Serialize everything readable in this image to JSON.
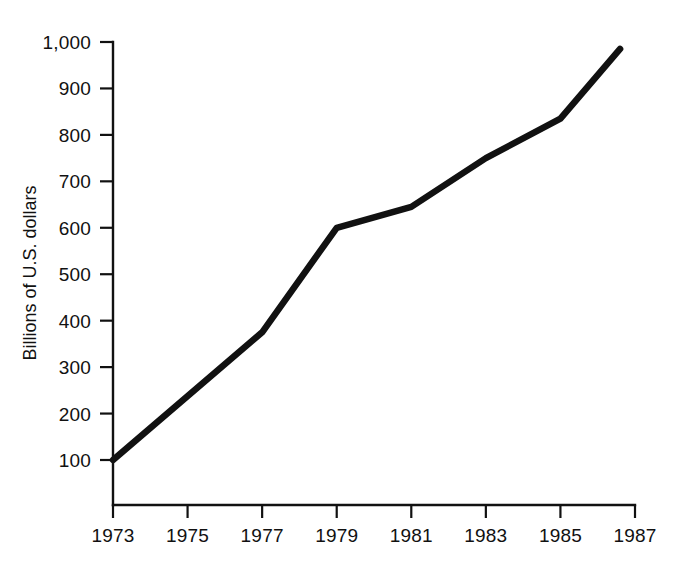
{
  "chart_data": {
    "type": "line",
    "title": "",
    "subtitle": "",
    "xlabel": "",
    "ylabel": "Billions of U.S. dollars",
    "x": [
      1973,
      1977,
      1979,
      1981,
      1983,
      1985,
      1986.6
    ],
    "values": [
      100,
      375,
      600,
      645,
      750,
      835,
      985
    ],
    "series": [
      {
        "name": "Billions of U.S. dollars",
        "color": "#111111",
        "values": [
          100,
          375,
          600,
          645,
          750,
          835,
          985
        ]
      }
    ],
    "xlim": [
      1973,
      1987
    ],
    "ylim": [
      0,
      1000
    ],
    "xticks": [
      1973,
      1975,
      1977,
      1979,
      1981,
      1983,
      1985,
      1987
    ],
    "xtick_labels": [
      "1973",
      "1975",
      "1977",
      "1979",
      "1981",
      "1983",
      "1985",
      "1987"
    ],
    "yticks": [
      100,
      200,
      300,
      400,
      500,
      600,
      700,
      800,
      900,
      1000
    ],
    "ytick_labels": [
      "100",
      "200",
      "300",
      "400",
      "500",
      "600",
      "700",
      "800",
      "900",
      "1,000"
    ],
    "grid": false,
    "legend": false,
    "legend_position": "none",
    "annotations": []
  },
  "axes": {
    "y_axis_title": "Billions of U.S. dollars",
    "x_axis_title": ""
  },
  "style": {
    "line_color": "#111111",
    "axis_color": "#111111",
    "background": "#ffffff"
  }
}
